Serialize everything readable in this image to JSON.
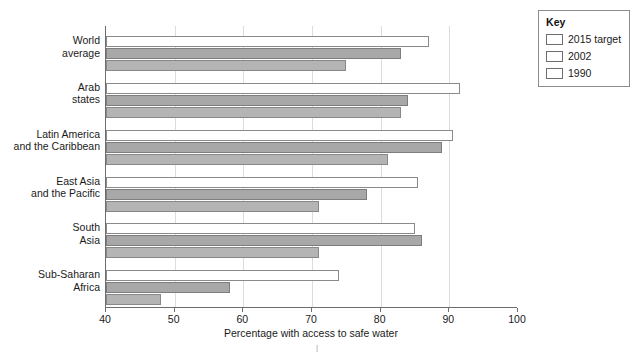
{
  "legend": {
    "title": "Key",
    "entries": [
      {
        "label": "2015 target",
        "color": "#ffffff"
      },
      {
        "label": "2002",
        "color": "#a8a8a8"
      },
      {
        "label": "1990",
        "color": "#b4b4b4"
      }
    ]
  },
  "axis": {
    "title": "Percentage with access to safe water",
    "ticks": [
      40,
      50,
      60,
      70,
      80,
      90,
      100
    ]
  },
  "chart_data": {
    "type": "bar",
    "orientation": "horizontal",
    "title": "",
    "xlabel": "Percentage with access to safe water",
    "ylabel": "",
    "xlim": [
      40,
      100
    ],
    "xticks": [
      40,
      50,
      60,
      70,
      80,
      90,
      100
    ],
    "grid": true,
    "legend_position": "top-right",
    "legend_title": "Key",
    "categories": [
      "World average",
      "Arab states",
      "Latin America and the Caribbean",
      "East Asia and the Pacific",
      "South Asia",
      "Sub-Saharan Africa"
    ],
    "category_lines": [
      [
        "World",
        "average"
      ],
      [
        "Arab",
        "states"
      ],
      [
        "Latin America",
        "and the Caribbean"
      ],
      [
        "East Asia",
        "and the Pacific"
      ],
      [
        "South",
        "Asia"
      ],
      [
        "Sub-Saharan",
        "Africa"
      ]
    ],
    "series": [
      {
        "name": "2015 target",
        "color": "#ffffff",
        "values": [
          87,
          91.5,
          90.5,
          85.5,
          85,
          74
        ]
      },
      {
        "name": "2002",
        "color": "#a8a8a8",
        "values": [
          83,
          84,
          89,
          78,
          86,
          58
        ]
      },
      {
        "name": "1990",
        "color": "#b4b4b4",
        "values": [
          75,
          83,
          81,
          71,
          71,
          48
        ]
      }
    ]
  }
}
